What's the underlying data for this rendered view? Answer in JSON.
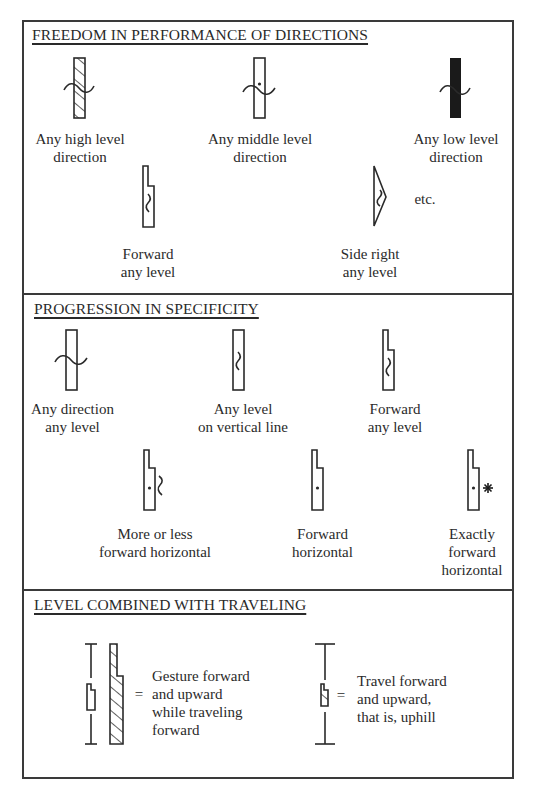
{
  "sections": [
    {
      "title": "FREEDOM IN PERFORMANCE OF DIRECTIONS",
      "items": [
        {
          "symbol": "high-level-any-direction",
          "label": "Any high level\ndirection"
        },
        {
          "symbol": "middle-level-any-direction",
          "label": "Any middle level\ndirection"
        },
        {
          "symbol": "low-level-any-direction",
          "label": "Any low level\ndirection"
        },
        {
          "symbol": "forward-any-level",
          "label": "Forward\nany level"
        },
        {
          "symbol": "side-right-any-level",
          "label": "Side right\nany level"
        }
      ],
      "etc": "etc."
    },
    {
      "title": "PROGRESSION IN SPECIFICITY",
      "items": [
        {
          "symbol": "any-direction-any-level",
          "label": "Any direction\nany level"
        },
        {
          "symbol": "any-level-vertical-line",
          "label": "Any level\non vertical line"
        },
        {
          "symbol": "forward-any-level",
          "label": "Forward\nany level"
        },
        {
          "symbol": "more-or-less-forward-horizontal",
          "label": "More or less\nforward horizontal"
        },
        {
          "symbol": "forward-horizontal",
          "label": "Forward\nhorizontal"
        },
        {
          "symbol": "exactly-forward-horizontal",
          "label": "Exactly\nforward\nhorizontal"
        }
      ]
    },
    {
      "title": "LEVEL COMBINED WITH TRAVELING",
      "items": [
        {
          "symbol": "gesture-with-travel",
          "equals": "=",
          "label": "Gesture forward\nand upward\nwhile traveling\nforward"
        },
        {
          "symbol": "travel-uphill",
          "equals": "=",
          "label": "Travel forward\nand upward,\nthat is, uphill"
        }
      ]
    }
  ]
}
